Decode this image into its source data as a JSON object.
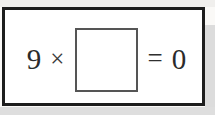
{
  "worksheet": {
    "problem": {
      "multiplicand": "9",
      "operator_symbol": "×",
      "answer_blank_value": "",
      "equals_symbol": "=",
      "product": "0"
    },
    "colors": {
      "frame_border": "#1d1d1d",
      "blank_border": "#555555",
      "text": "#2b2b2b",
      "paper": "#ffffff",
      "page_margin": "#dcdcdc"
    }
  }
}
